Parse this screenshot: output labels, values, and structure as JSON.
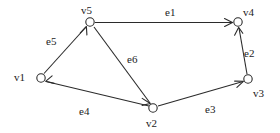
{
  "figure": {
    "type": "directed-graph",
    "background_color": "#ffffff",
    "stroke_color": "#2b2b2b",
    "text_color": "#1c1c1c"
  },
  "vertices": [
    {
      "id": "v1",
      "label": "v1",
      "cx": 41,
      "cy": 78,
      "label_x": 14,
      "label_y": 72
    },
    {
      "id": "v2",
      "label": "v2",
      "cx": 153,
      "cy": 108,
      "label_x": 146,
      "label_y": 118
    },
    {
      "id": "v3",
      "label": "v3",
      "cx": 248,
      "cy": 79,
      "label_x": 253,
      "label_y": 88
    },
    {
      "id": "v4",
      "label": "v4",
      "cx": 238,
      "cy": 22,
      "label_x": 243,
      "label_y": 7
    },
    {
      "id": "v5",
      "label": "v5",
      "cx": 90,
      "cy": 22,
      "label_x": 81,
      "label_y": 5
    }
  ],
  "edges": [
    {
      "id": "e1",
      "label": "e1",
      "from": "v5",
      "to": "v4",
      "label_x": 165,
      "label_y": 7
    },
    {
      "id": "e2",
      "label": "e2",
      "from": "v3",
      "to": "v4",
      "label_x": 244,
      "label_y": 48
    },
    {
      "id": "e3",
      "label": "e3",
      "from": "v2",
      "to": "v3",
      "label_x": 205,
      "label_y": 104
    },
    {
      "id": "e4",
      "label": "e4",
      "from": "v2",
      "to": "v1",
      "label_x": 79,
      "label_y": 106
    },
    {
      "id": "e5",
      "label": "e5",
      "from": "v1",
      "to": "v5",
      "label_x": 46,
      "label_y": 36
    },
    {
      "id": "e6",
      "label": "e6",
      "from": "v5",
      "to": "v2",
      "label_x": 127,
      "label_y": 54
    }
  ]
}
